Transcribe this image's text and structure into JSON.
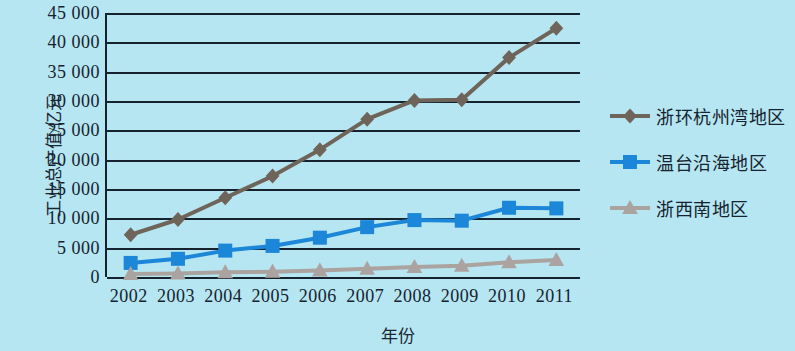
{
  "chart_data": {
    "type": "line",
    "title": "",
    "xlabel": "年份",
    "ylabel": "工业总产值/亿元",
    "categories": [
      "2002",
      "2003",
      "2004",
      "2005",
      "2006",
      "2007",
      "2008",
      "2009",
      "2010",
      "2011"
    ],
    "ylim": [
      0,
      45000
    ],
    "ytick_labels": [
      "0",
      "5 000",
      "10 000",
      "15 000",
      "20 000",
      "25 000",
      "30 000",
      "35 000",
      "40 000",
      "45 000"
    ],
    "ytick_values": [
      0,
      5000,
      10000,
      15000,
      20000,
      25000,
      30000,
      35000,
      40000,
      45000
    ],
    "grid": true,
    "legend_position": "right",
    "series": [
      {
        "name": "浙环杭州湾地区",
        "marker": "diamond",
        "color": "#6f6459",
        "values": [
          7200,
          9800,
          13500,
          17200,
          21700,
          26900,
          30100,
          30200,
          37400,
          42400
        ]
      },
      {
        "name": "温台沿海地区",
        "marker": "square",
        "color": "#1c86d8",
        "values": [
          2400,
          3100,
          4500,
          5300,
          6700,
          8500,
          9700,
          9600,
          11800,
          11700
        ]
      },
      {
        "name": "浙西南地区",
        "marker": "triangle",
        "color": "#aaa3a0",
        "values": [
          500,
          600,
          800,
          900,
          1100,
          1400,
          1700,
          1900,
          2500,
          2900
        ]
      }
    ]
  },
  "colors": {
    "background": "#b5e6f2",
    "axis": "#16222e",
    "series1": "#6f6459",
    "series2": "#1c86d8",
    "series3": "#aaa3a0"
  }
}
